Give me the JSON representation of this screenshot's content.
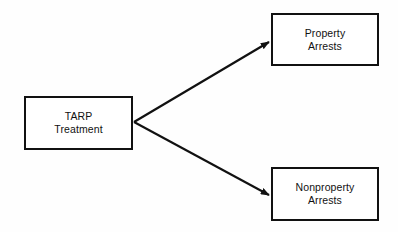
{
  "diagram": {
    "type": "flowchart",
    "orientation": "left-to-right",
    "background_color": "#fefefe",
    "line_color": "#111111",
    "box_fill_color": "#ffffff",
    "nodes": [
      {
        "id": "treatment",
        "label": "TARP\nTreatment",
        "line1": "TARP",
        "line2": "Treatment",
        "role": "source"
      },
      {
        "id": "property",
        "label": "Property\nArrests",
        "line1": "Property",
        "line2": "Arrests",
        "role": "outcome"
      },
      {
        "id": "nonproperty",
        "label": "Nonproperty\nArrests",
        "line1": "Nonproperty",
        "line2": "Arrests",
        "role": "outcome"
      }
    ],
    "edges": [
      {
        "id": "edge-treatment-property",
        "from": "treatment",
        "to": "property",
        "label": "",
        "arrowhead": "filled-triangle"
      },
      {
        "id": "edge-treatment-nonproperty",
        "from": "treatment",
        "to": "nonproperty",
        "label": "",
        "arrowhead": "filled-triangle"
      }
    ]
  }
}
